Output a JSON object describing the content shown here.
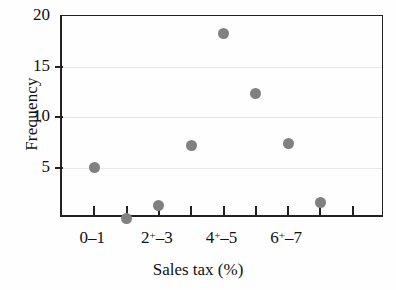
{
  "chart_data": {
    "type": "scatter",
    "title": "",
    "xlabel": "Sales tax (%)",
    "ylabel": "Frequency",
    "ylim": [
      0,
      20
    ],
    "yticks": [
      5,
      10,
      15,
      20
    ],
    "ytick_labels": [
      "5",
      "10",
      "15",
      "20"
    ],
    "grid": "horizontal",
    "legend": "none",
    "x_tick_count": 9,
    "x_tick_labels": [
      {
        "text": "0–1",
        "tick_index": 1,
        "base": "0–1",
        "sup": ""
      },
      {
        "text": "2⁺–3",
        "tick_index": 3,
        "base_left": "2",
        "sup": "+",
        "base_right": "–3"
      },
      {
        "text": "4⁺–5",
        "tick_index": 5,
        "base_left": "4",
        "sup": "+",
        "base_right": "–5"
      },
      {
        "text": "6⁺–7",
        "tick_index": 7,
        "base_left": "6",
        "sup": "+",
        "base_right": "–7"
      }
    ],
    "categories": [
      "0–1",
      "1⁺–2",
      "2⁺–3",
      "3⁺–4",
      "4⁺–5",
      "5⁺–6",
      "6⁺–7",
      "7⁺–8"
    ],
    "x": [
      1,
      2,
      3,
      4,
      5,
      6,
      7,
      8
    ],
    "values": [
      5.0,
      0.0,
      1.2,
      7.2,
      18.3,
      12.3,
      7.4,
      1.5
    ],
    "marker_color": "#808080",
    "marker_shape": "circle",
    "axis_color": "#222222",
    "grid_color": "#e8e8e8",
    "background": "#fefefe"
  }
}
